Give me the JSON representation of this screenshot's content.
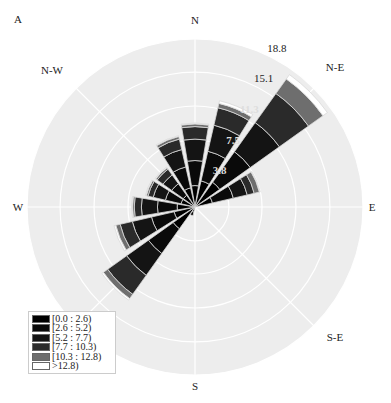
{
  "panel_label": "A",
  "chart_data": {
    "type": "windrose",
    "title": "",
    "directions": [
      "N",
      "NNE",
      "NE",
      "ENE",
      "E",
      "ESE",
      "SE",
      "SSE",
      "S",
      "SSW",
      "SW",
      "WSW",
      "W",
      "WNW",
      "NW",
      "NNW"
    ],
    "angles_deg": [
      0,
      22.5,
      45,
      67.5,
      90,
      112.5,
      135,
      157.5,
      180,
      202.5,
      225,
      247.5,
      270,
      292.5,
      315,
      337.5
    ],
    "bins": [
      "[0.0 : 2.6)",
      "[2.6 : 5.2)",
      "[5.2 : 7.7)",
      "[7.7 : 10.3)",
      "[10.3 : 12.8)",
      ">12.8)"
    ],
    "bin_colors": [
      "#000000",
      "#0a0a0a",
      "#141414",
      "#2a2a2a",
      "#6e6e6e",
      "#ffffff"
    ],
    "series": [
      {
        "name": "[0.0 : 2.6)",
        "values": [
          2.4,
          3.0,
          3.4,
          2.0,
          0,
          0,
          0,
          0,
          0,
          0.6,
          3.0,
          2.4,
          2.0,
          1.6,
          1.6,
          2.2
        ]
      },
      {
        "name": "[2.6 : 5.2)",
        "values": [
          2.8,
          3.4,
          4.2,
          2.4,
          0,
          0,
          0,
          0,
          0,
          0.4,
          3.4,
          2.6,
          2.2,
          1.8,
          1.6,
          2.4
        ]
      },
      {
        "name": "[5.2 : 7.7)",
        "values": [
          2.4,
          3.0,
          4.0,
          1.6,
          0,
          0,
          0,
          0,
          0,
          0,
          3.0,
          2.2,
          1.8,
          1.4,
          1.2,
          2.0
        ]
      },
      {
        "name": "[7.7 : 10.3)",
        "values": [
          1.4,
          2.0,
          4.0,
          0.8,
          0,
          0,
          0,
          0,
          0,
          0,
          2.6,
          1.4,
          0.8,
          0.6,
          0.8,
          1.2
        ]
      },
      {
        "name": "[10.3 : 12.8)",
        "values": [
          0.3,
          0.5,
          2.0,
          0.6,
          0,
          0,
          0,
          0,
          0,
          0,
          0.6,
          0.5,
          0.2,
          0.2,
          0.2,
          0.3
        ]
      },
      {
        "name": ">12.8)",
        "values": [
          0.1,
          0.3,
          0.6,
          0.1,
          0,
          0,
          0,
          0,
          0,
          0,
          0.2,
          0.2,
          0.1,
          0.1,
          0.1,
          0.1
        ]
      }
    ],
    "radial_ticks": [
      3.8,
      7.5,
      11.3,
      15.1,
      18.8
    ],
    "rmax": 18.8,
    "compass_labels": {
      "N": "N",
      "NE": "N-E",
      "E": "E",
      "SE": "S-E",
      "S": "S",
      "SW": "S-W",
      "W": "W",
      "NW": "N-W"
    },
    "legend_position": "lower-left",
    "grid": true
  },
  "legend": {
    "items": [
      {
        "label": "[0.0 : 2.6)",
        "color": "#000000"
      },
      {
        "label": "[2.6 : 5.2)",
        "color": "#0a0a0a"
      },
      {
        "label": "[5.2 : 7.7)",
        "color": "#141414"
      },
      {
        "label": "[7.7 : 10.3)",
        "color": "#2a2a2a"
      },
      {
        "label": "[10.3 : 12.8)",
        "color": "#6e6e6e"
      },
      {
        "label": ">12.8)",
        "color": "#ffffff"
      }
    ]
  }
}
